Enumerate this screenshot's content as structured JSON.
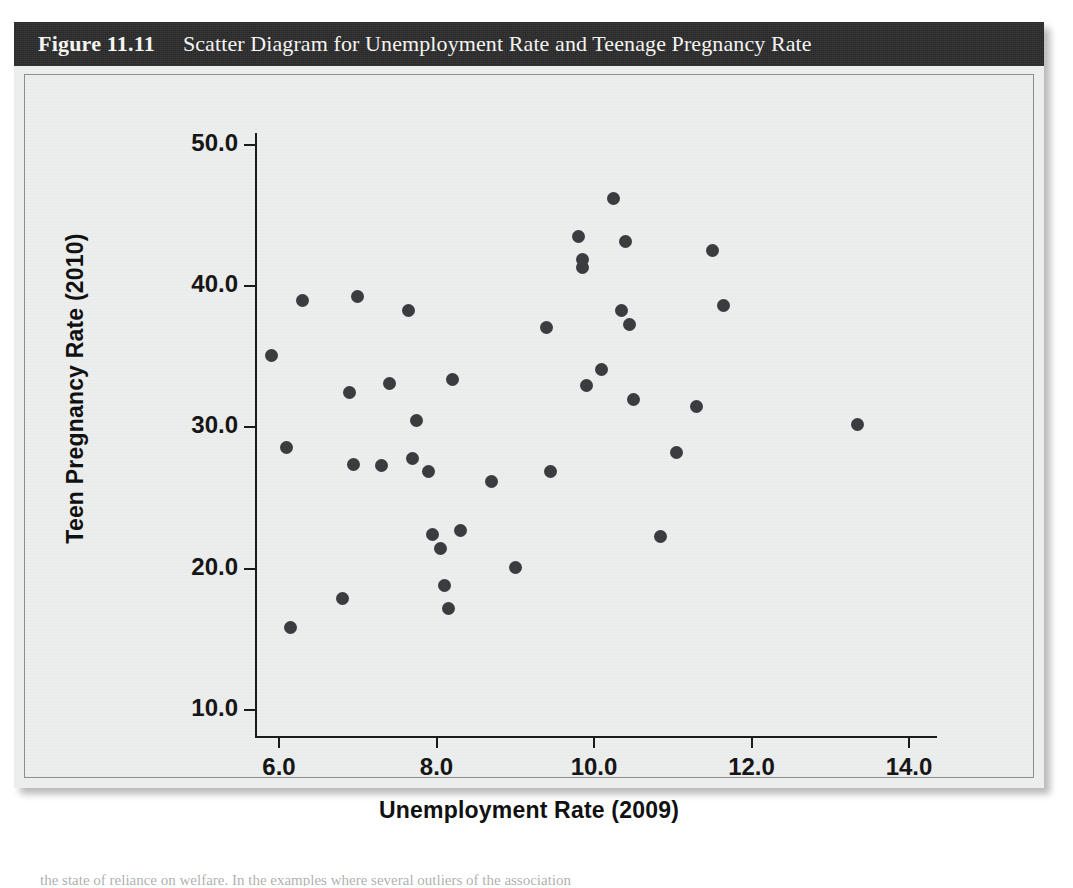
{
  "figure": {
    "number": "Figure 11.11",
    "title": "Scatter Diagram for Unemployment Rate and Teenage Pregnancy Rate",
    "bar_color": "#2b2b2b",
    "panel_color": "#eceded",
    "point_color": "#3a3c3f"
  },
  "chart_data": {
    "type": "scatter",
    "title": "Scatter Diagram for Unemployment Rate and Teenage Pregnancy Rate",
    "xlabel": "Unemployment Rate (2009)",
    "ylabel": "Teen Pregnancy Rate (2010)",
    "xlim": [
      5.2,
      14.9
    ],
    "ylim": [
      8.6,
      52.0
    ],
    "xticks": [
      "6.0",
      "8.0",
      "10.0",
      "12.0",
      "14.0"
    ],
    "xtick_values": [
      6.0,
      8.0,
      10.0,
      12.0,
      14.0
    ],
    "yticks": [
      "10.0",
      "20.0",
      "30.0",
      "40.0",
      "50.0"
    ],
    "ytick_values": [
      10.0,
      20.0,
      30.0,
      40.0,
      50.0
    ],
    "grid": false,
    "legend": null,
    "marker": "filled-circle",
    "points": [
      [
        5.9,
        35.1
      ],
      [
        6.1,
        28.6
      ],
      [
        6.15,
        15.8
      ],
      [
        6.3,
        39.0
      ],
      [
        6.8,
        17.9
      ],
      [
        6.9,
        32.5
      ],
      [
        6.95,
        27.4
      ],
      [
        7.0,
        39.3
      ],
      [
        7.3,
        27.3
      ],
      [
        7.4,
        33.1
      ],
      [
        7.65,
        38.3
      ],
      [
        7.7,
        27.8
      ],
      [
        7.75,
        30.5
      ],
      [
        7.9,
        26.9
      ],
      [
        7.95,
        22.4
      ],
      [
        8.05,
        21.4
      ],
      [
        8.1,
        18.8
      ],
      [
        8.15,
        17.2
      ],
      [
        8.2,
        33.4
      ],
      [
        8.3,
        22.7
      ],
      [
        8.7,
        26.2
      ],
      [
        9.0,
        20.1
      ],
      [
        9.4,
        37.1
      ],
      [
        9.45,
        26.9
      ],
      [
        9.8,
        43.5
      ],
      [
        9.85,
        41.9
      ],
      [
        9.85,
        41.3
      ],
      [
        9.9,
        33.0
      ],
      [
        10.1,
        34.1
      ],
      [
        10.25,
        46.2
      ],
      [
        10.35,
        38.3
      ],
      [
        10.4,
        43.2
      ],
      [
        10.45,
        37.3
      ],
      [
        10.5,
        32.0
      ],
      [
        10.85,
        22.3
      ],
      [
        11.05,
        28.2
      ],
      [
        11.3,
        31.5
      ],
      [
        11.5,
        42.5
      ],
      [
        11.65,
        38.6
      ],
      [
        13.35,
        30.2
      ]
    ],
    "n_points": 40
  },
  "bleed_text": {
    "bottom_line": "the state of reliance on welfare. In the examples where several outliers of the association"
  }
}
